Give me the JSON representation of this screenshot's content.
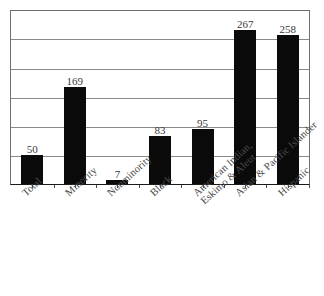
{
  "chart_data": {
    "type": "bar",
    "title": "",
    "subtitle": "",
    "xlabel": "",
    "ylabel": "",
    "ylim": [
      0,
      300
    ],
    "ytick_step": 50,
    "ytick_labels_shown": false,
    "grid": true,
    "legend": false,
    "bar_color": "#0a0a0a",
    "gridline_color": "#8a8a8a",
    "frame_color": "#6e6e6e",
    "value_label_color": "#3a3a3a",
    "categories": [
      "Total",
      "Minority",
      "Nonminority",
      "Black",
      "American Indian, Eskimo & Aleut",
      "Asian & Pacific Islander",
      "Hispanic"
    ],
    "category_lines": [
      [
        "Total"
      ],
      [
        "Minority"
      ],
      [
        "Nonminority"
      ],
      [
        "Black"
      ],
      [
        "American Indian,",
        "Eskimo & Aleut"
      ],
      [
        "Asian & Pacific Islander"
      ],
      [
        "Hispanic"
      ]
    ],
    "values": [
      50,
      169,
      7,
      83,
      95,
      267,
      258
    ],
    "value_labels": [
      "50",
      "169",
      "7",
      "83",
      "95",
      "267",
      "258"
    ]
  }
}
